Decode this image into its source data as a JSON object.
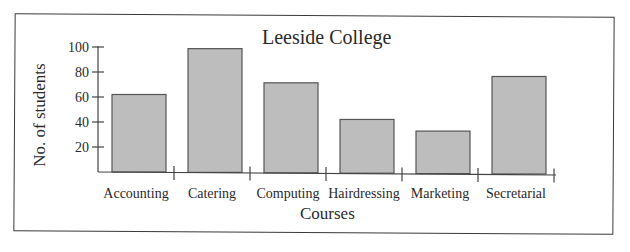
{
  "chart_data": {
    "type": "bar",
    "title": "Leeside College",
    "xlabel": "Courses",
    "ylabel": "No. of students",
    "categories": [
      "Accounting",
      "Catering",
      "Computing",
      "Hairdressing",
      "Marketing",
      "Secretarial"
    ],
    "values": [
      62,
      99,
      72,
      43,
      34,
      78
    ],
    "yticks": [
      20,
      40,
      60,
      80,
      100
    ],
    "ylim": [
      0,
      100
    ],
    "grid": false,
    "legend": null,
    "bar_color": "#bdbdbd",
    "bar_edge_color": "#555555"
  }
}
